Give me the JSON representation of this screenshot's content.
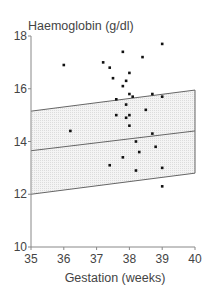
{
  "chart_data": {
    "type": "scatter",
    "title": "",
    "ylabel": "Haemoglobin (g/dl)",
    "xlabel": "Gestation (weeks)",
    "xlim": [
      35,
      40
    ],
    "ylim": [
      10,
      18
    ],
    "xticks": [
      35,
      36,
      37,
      38,
      39,
      40
    ],
    "yticks": [
      10,
      12,
      14,
      16,
      18
    ],
    "grid": false,
    "legend": null,
    "reference_band": {
      "description": "shaded reference range band with upper, middle (mean) and lower lines",
      "upper": [
        [
          35,
          15.15
        ],
        [
          40,
          15.95
        ]
      ],
      "middle": [
        [
          35,
          13.65
        ],
        [
          40,
          14.4
        ]
      ],
      "lower": [
        [
          35,
          12.0
        ],
        [
          40,
          12.8
        ]
      ],
      "fill": "#e9e9e9"
    },
    "series": [
      {
        "name": "observations",
        "points": [
          [
            36.0,
            16.9
          ],
          [
            37.2,
            17.0
          ],
          [
            37.4,
            16.8
          ],
          [
            37.8,
            17.4
          ],
          [
            38.4,
            17.2
          ],
          [
            39.0,
            17.7
          ],
          [
            37.5,
            16.4
          ],
          [
            38.0,
            16.6
          ],
          [
            37.9,
            16.3
          ],
          [
            37.8,
            16.1
          ],
          [
            38.0,
            15.8
          ],
          [
            37.6,
            15.6
          ],
          [
            38.1,
            15.7
          ],
          [
            38.7,
            15.8
          ],
          [
            39.0,
            15.7
          ],
          [
            37.9,
            15.4
          ],
          [
            38.5,
            15.2
          ],
          [
            37.6,
            15.0
          ],
          [
            37.9,
            14.9
          ],
          [
            38.0,
            15.0
          ],
          [
            38.0,
            14.6
          ],
          [
            36.2,
            14.4
          ],
          [
            38.7,
            14.3
          ],
          [
            38.2,
            14.0
          ],
          [
            38.8,
            13.8
          ],
          [
            37.4,
            13.1
          ],
          [
            37.8,
            13.4
          ],
          [
            38.3,
            13.6
          ],
          [
            38.2,
            12.9
          ],
          [
            39.0,
            13.0
          ],
          [
            39.0,
            12.3
          ]
        ]
      }
    ]
  },
  "colors": {
    "axis": "#888888",
    "band_line": "#666666",
    "band_fill": "#e9e9e9",
    "point": "#111111",
    "text": "#444444"
  }
}
